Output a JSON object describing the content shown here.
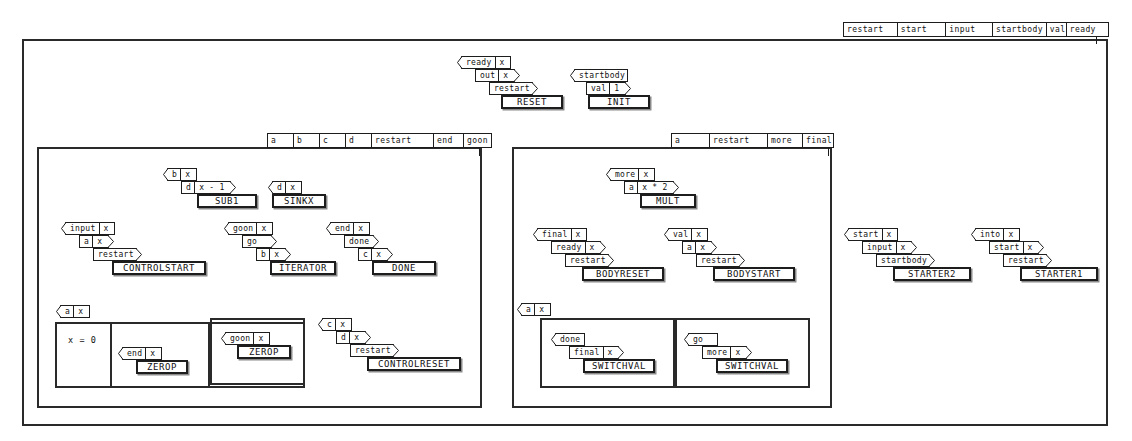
{
  "diagram": {
    "style": {
      "line_color": "#1d1d1d",
      "background": "#ffffff",
      "shadow_color": "#8a8a8a"
    }
  },
  "top_header": {
    "name": "global-signal-bar",
    "columns": [
      "restart",
      "start",
      "input",
      "startbody",
      "val",
      "ready"
    ]
  },
  "top_rules": [
    {
      "name": "RESET",
      "rows": [
        {
          "label": "ready",
          "value": "x"
        },
        {
          "label": "out",
          "value": "x"
        },
        {
          "label": "restart",
          "value": ""
        }
      ]
    },
    {
      "name": "INIT",
      "rows": [
        {
          "label": "startbody",
          "value": ""
        },
        {
          "label": "val",
          "value": "1"
        }
      ]
    }
  ],
  "left_group": {
    "header": {
      "name": "left-group-signal-bar",
      "columns": [
        "a",
        "b",
        "c",
        "d",
        "restart",
        "end",
        "goon"
      ]
    },
    "rules": [
      {
        "name": "SUB1",
        "rows": [
          {
            "label": "b",
            "value": "x"
          },
          {
            "label": "d",
            "value": "x - 1"
          }
        ]
      },
      {
        "name": "SINKX",
        "rows": [
          {
            "label": "d",
            "value": "x"
          }
        ]
      },
      {
        "name": "CONTROLSTART",
        "rows": [
          {
            "label": "input",
            "value": "x"
          },
          {
            "label": "a",
            "value": "x"
          },
          {
            "label": "restart",
            "value": ""
          }
        ]
      },
      {
        "name": "ITERATOR",
        "rows": [
          {
            "label": "goon",
            "value": "x"
          },
          {
            "label": "go",
            "value": ""
          },
          {
            "label": "b",
            "value": "x"
          }
        ]
      },
      {
        "name": "DONE",
        "rows": [
          {
            "label": "end",
            "value": "x"
          },
          {
            "label": "done",
            "value": ""
          },
          {
            "label": "c",
            "value": "x"
          }
        ]
      },
      {
        "name": "CONTROLRESET",
        "rows": [
          {
            "label": "c",
            "value": "x"
          },
          {
            "label": "d",
            "value": "x"
          },
          {
            "label": "restart",
            "value": ""
          }
        ]
      }
    ],
    "guard": {
      "header": {
        "label": "a",
        "value": "x"
      },
      "condition": "x = 0",
      "branches": [
        {
          "name": "ZEROP",
          "rows": [
            {
              "label": "end",
              "value": "x"
            }
          ]
        },
        {
          "name": "ZEROP",
          "rows": [
            {
              "label": "goon",
              "value": "x"
            }
          ]
        }
      ]
    }
  },
  "right_group": {
    "header": {
      "name": "right-group-signal-bar",
      "columns": [
        "a",
        "restart",
        "more",
        "final"
      ]
    },
    "rules": [
      {
        "name": "MULT",
        "rows": [
          {
            "label": "more",
            "value": "x"
          },
          {
            "label": "a",
            "value": "x * 2"
          }
        ]
      },
      {
        "name": "BODYRESET",
        "rows": [
          {
            "label": "final",
            "value": "x"
          },
          {
            "label": "ready",
            "value": "x"
          },
          {
            "label": "restart",
            "value": ""
          }
        ]
      },
      {
        "name": "BODYSTART",
        "rows": [
          {
            "label": "val",
            "value": "x"
          },
          {
            "label": "a",
            "value": "x"
          },
          {
            "label": "restart",
            "value": ""
          }
        ]
      }
    ],
    "guard": {
      "header": {
        "label": "a",
        "value": "x"
      },
      "branches": [
        {
          "name": "SWITCHVAL",
          "rows": [
            {
              "label": "done",
              "value": ""
            },
            {
              "label": "final",
              "value": "x"
            }
          ]
        },
        {
          "name": "SWITCHVAL",
          "rows": [
            {
              "label": "go",
              "value": ""
            },
            {
              "label": "more",
              "value": "x"
            }
          ]
        }
      ]
    }
  },
  "standalone_rules": [
    {
      "name": "STARTER2",
      "rows": [
        {
          "label": "start",
          "value": "x"
        },
        {
          "label": "input",
          "value": "x"
        },
        {
          "label": "startbody",
          "value": ""
        }
      ]
    },
    {
      "name": "STARTER1",
      "rows": [
        {
          "label": "into",
          "value": "x"
        },
        {
          "label": "start",
          "value": "x"
        },
        {
          "label": "restart",
          "value": ""
        }
      ]
    }
  ]
}
